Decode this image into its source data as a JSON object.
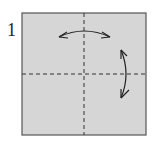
{
  "diagram": {
    "step_number": "1",
    "paper_color": "#d6d6d6",
    "border_color": "#555555",
    "line_color": "#333333",
    "folds": [
      {
        "type": "valley-fold-crease",
        "orientation": "vertical"
      },
      {
        "type": "valley-fold-crease",
        "orientation": "horizontal"
      }
    ],
    "arrows": [
      {
        "type": "fold-and-unfold",
        "orientation": "horizontal"
      },
      {
        "type": "fold-and-unfold",
        "orientation": "vertical"
      }
    ]
  }
}
